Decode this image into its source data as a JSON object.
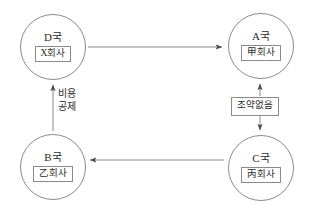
{
  "diagram": {
    "type": "transfer-pricing-country-relationship-diagram",
    "stroke_color": "#8a8a8a",
    "text_color": "#2b2b2b",
    "background_color": "#ffffff",
    "nodes": [
      {
        "id": "node-d",
        "country": "D국",
        "company": "X회사",
        "position": "top-left"
      },
      {
        "id": "node-a",
        "country": "A국",
        "company": "甲회사",
        "position": "top-right"
      },
      {
        "id": "node-b",
        "country": "B국",
        "company": "乙회사",
        "position": "bottom-left"
      },
      {
        "id": "node-c",
        "country": "C국",
        "company": "丙회사",
        "position": "bottom-right"
      }
    ],
    "edges": [
      {
        "id": "edge-d-to-a",
        "from": "node-d",
        "to": "node-a",
        "direction": "right",
        "label": ""
      },
      {
        "id": "edge-c-to-b",
        "from": "node-c",
        "to": "node-b",
        "direction": "left",
        "label": ""
      },
      {
        "id": "edge-b-to-d",
        "from": "node-b",
        "to": "node-d",
        "direction": "up",
        "label_line1": "비용",
        "label_line2": "공제"
      },
      {
        "id": "edge-a-c-treaty",
        "from": "node-c",
        "to": "node-a",
        "direction": "both",
        "label": "조약없음"
      }
    ]
  }
}
